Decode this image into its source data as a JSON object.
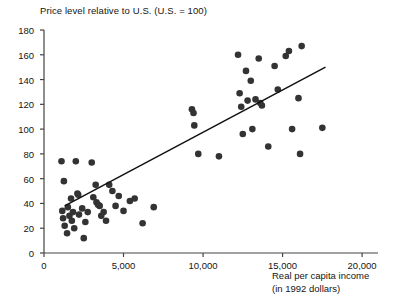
{
  "chart_data": {
    "type": "scatter",
    "title": "Price level relative to U.S. (U.S. = 100)",
    "xlabel_line1": "Real per capita income",
    "xlabel_line2": "(in 1992 dollars)",
    "ylabel": "",
    "xlim": [
      0,
      21000
    ],
    "ylim": [
      0,
      180
    ],
    "xticks": [
      0,
      5000,
      10000,
      15000,
      20000
    ],
    "xtick_labels": [
      "0",
      "5,000",
      "10,000",
      "15,000",
      "20,000"
    ],
    "yticks": [
      0,
      20,
      40,
      60,
      80,
      100,
      120,
      140,
      160,
      180
    ],
    "ytick_labels": [
      "0",
      "20",
      "40",
      "60",
      "80",
      "100",
      "120",
      "140",
      "160",
      "180"
    ],
    "grid": false,
    "legend": false,
    "marker_color": "#333333",
    "marker_size": 3.3,
    "line_color": "#111111",
    "trendline": {
      "label": "regression line",
      "x_start": 1300,
      "y_start": 38,
      "x_end": 17700,
      "y_end": 150
    },
    "points": [
      [
        1100,
        74
      ],
      [
        1250,
        58
      ],
      [
        1150,
        34
      ],
      [
        1200,
        28
      ],
      [
        1300,
        22
      ],
      [
        1450,
        16
      ],
      [
        1500,
        37
      ],
      [
        1600,
        30
      ],
      [
        1700,
        44
      ],
      [
        1750,
        26
      ],
      [
        1820,
        33
      ],
      [
        1900,
        20
      ],
      [
        2000,
        74
      ],
      [
        2100,
        48
      ],
      [
        2150,
        47
      ],
      [
        2200,
        31
      ],
      [
        2400,
        36
      ],
      [
        2500,
        12
      ],
      [
        2600,
        25
      ],
      [
        2750,
        33
      ],
      [
        3000,
        73
      ],
      [
        3100,
        45
      ],
      [
        3250,
        55
      ],
      [
        3300,
        41
      ],
      [
        3400,
        39
      ],
      [
        3500,
        38
      ],
      [
        3600,
        30
      ],
      [
        3750,
        33
      ],
      [
        3900,
        26
      ],
      [
        4100,
        55
      ],
      [
        4300,
        50
      ],
      [
        4500,
        38
      ],
      [
        4700,
        46
      ],
      [
        5000,
        34
      ],
      [
        5400,
        42
      ],
      [
        5700,
        44
      ],
      [
        6200,
        24
      ],
      [
        6900,
        37
      ],
      [
        9300,
        116
      ],
      [
        9400,
        113
      ],
      [
        9450,
        103
      ],
      [
        9700,
        80
      ],
      [
        11000,
        78
      ],
      [
        12200,
        160
      ],
      [
        12300,
        129
      ],
      [
        12400,
        118
      ],
      [
        12500,
        96
      ],
      [
        12700,
        147
      ],
      [
        12800,
        123
      ],
      [
        13000,
        139
      ],
      [
        13100,
        100
      ],
      [
        13300,
        124
      ],
      [
        13500,
        157
      ],
      [
        13600,
        121
      ],
      [
        13700,
        119
      ],
      [
        14100,
        86
      ],
      [
        14500,
        151
      ],
      [
        14700,
        132
      ],
      [
        15200,
        159
      ],
      [
        15400,
        163
      ],
      [
        15600,
        100
      ],
      [
        16000,
        125
      ],
      [
        16100,
        80
      ],
      [
        16200,
        167
      ],
      [
        17500,
        101
      ]
    ]
  }
}
